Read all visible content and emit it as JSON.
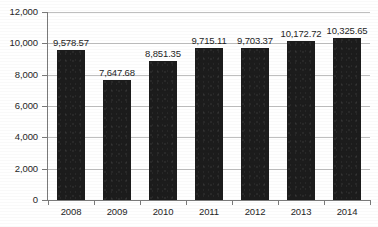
{
  "chart_data": {
    "type": "bar",
    "title": "",
    "subtitle": "",
    "xlabel": "",
    "ylabel": "",
    "categories": [
      "2008",
      "2009",
      "2010",
      "2011",
      "2012",
      "2013",
      "2014"
    ],
    "values": [
      9578.57,
      7647.68,
      8851.35,
      9715.11,
      9703.37,
      10172.72,
      10325.65
    ],
    "data_labels": [
      "9,578.57",
      "7,647.68",
      "8,851.35",
      "9,715.11",
      "9,703.37",
      "10,172.72",
      "10,325.65"
    ],
    "ylim": [
      0,
      12000
    ],
    "ytick_values": [
      0,
      2000,
      4000,
      6000,
      8000,
      10000,
      12000
    ],
    "ytick_labels": [
      "0",
      "2,000",
      "4,000",
      "6,000",
      "8,000",
      "10,000",
      "12,000"
    ],
    "grid": true,
    "legend": false,
    "legend_position": "none",
    "series": [
      {
        "name": "",
        "values": [
          9578.57,
          7647.68,
          8851.35,
          9715.11,
          9703.37,
          10172.72,
          10325.65
        ]
      }
    ],
    "colors": {
      "bar": "#1c1c1c",
      "gridline": "#bfbfbf",
      "axis": "#7a7a7a",
      "text": "#262626",
      "background": "#ffffff"
    }
  }
}
